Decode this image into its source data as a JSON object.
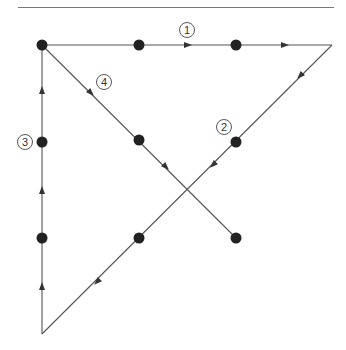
{
  "header": {
    "text": ""
  },
  "diagram": {
    "line_color": "#555555",
    "dot_color": "#222222",
    "dots": [
      {
        "x": 42,
        "y": 45
      },
      {
        "x": 139,
        "y": 45
      },
      {
        "x": 236,
        "y": 45
      },
      {
        "x": 42,
        "y": 142
      },
      {
        "x": 139,
        "y": 140
      },
      {
        "x": 236,
        "y": 142
      },
      {
        "x": 42,
        "y": 238
      },
      {
        "x": 139,
        "y": 238
      },
      {
        "x": 236,
        "y": 238
      }
    ],
    "segments": [
      {
        "id": 1,
        "label": "1",
        "from": [
          42,
          45
        ],
        "to": [
          332,
          45
        ],
        "label_pos": [
          187,
          30
        ]
      },
      {
        "id": 2,
        "label": "2",
        "from": [
          332,
          45
        ],
        "to": [
          42,
          334
        ],
        "label_pos": [
          224,
          127
        ]
      },
      {
        "id": 3,
        "label": "3",
        "from": [
          42,
          334
        ],
        "to": [
          42,
          45
        ],
        "label_pos": [
          25,
          142
        ]
      },
      {
        "id": 4,
        "label": "4",
        "from": [
          42,
          45
        ],
        "to": [
          236,
          238
        ],
        "label_pos": [
          104,
          82
        ]
      }
    ],
    "labels": [
      "1",
      "2",
      "3",
      "4"
    ]
  }
}
